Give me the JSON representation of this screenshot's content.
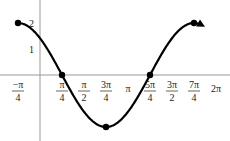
{
  "chart_data": {
    "type": "line",
    "title": "",
    "function": "y = 2cos(x + π/4)",
    "xlabel": "",
    "ylabel": "",
    "x_ticks": [
      {
        "label_num": "−π",
        "label_den": "4",
        "x": -0.785
      },
      {
        "label_num": "π",
        "label_den": "4",
        "x": 0.785
      },
      {
        "label_num": "π",
        "label_den": "2",
        "x": 1.571
      },
      {
        "label_num": "3π",
        "label_den": "4",
        "x": 2.356
      },
      {
        "label_num": "π",
        "label_den": "",
        "x": 3.142
      },
      {
        "label_num": "5π",
        "label_den": "4",
        "x": 3.927
      },
      {
        "label_num": "3π",
        "label_den": "2",
        "x": 4.712
      },
      {
        "label_num": "7π",
        "label_den": "4",
        "x": 5.498
      },
      {
        "label_num": "2π",
        "label_den": "",
        "x": 6.283
      }
    ],
    "y_ticks": [
      {
        "label": "2",
        "y": 2
      },
      {
        "label": "1",
        "y": 1
      }
    ],
    "key_points": [
      {
        "x": -0.785,
        "y": 2
      },
      {
        "x": 0.785,
        "y": 0
      },
      {
        "x": 2.356,
        "y": -2
      },
      {
        "x": 3.927,
        "y": 0
      },
      {
        "x": 5.498,
        "y": 2
      }
    ],
    "xlim": [
      -1.0,
      6.6
    ],
    "ylim": [
      -2.3,
      2.3
    ],
    "grid": false,
    "legend": null
  }
}
